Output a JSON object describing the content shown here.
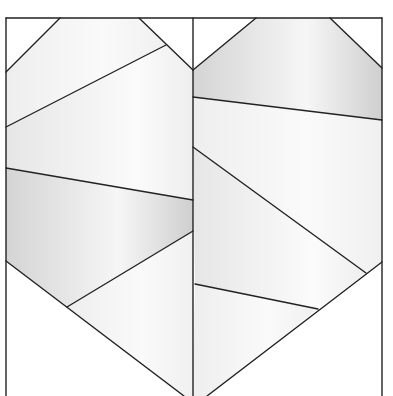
{
  "diagram": {
    "type": "geometric-line-pattern",
    "width": 393,
    "height": 396,
    "stroke_color": "#222222",
    "stroke_width": 1.4,
    "background": "#ffffff",
    "outer_frame": {
      "left": 6,
      "top": 18,
      "right": 382,
      "divider_x": 193
    },
    "shades": {
      "light": "#f3f3f3",
      "mid": "#e4e4e4",
      "dark": "#d2d2d2",
      "white": "#ffffff"
    },
    "regions": [
      {
        "name": "left-top-corner-triangle",
        "shade": "white",
        "points": "6,18 60,18 6,72"
      },
      {
        "name": "left-upper-band",
        "shade": "light",
        "points": "60,18 139,18 166,45 6,127 6,72"
      },
      {
        "name": "left-top-right-triangle",
        "shade": "white",
        "points": "139,18 193,18 193,70"
      },
      {
        "name": "left-middle-band",
        "shade": "mid",
        "points": "166,45 193,70 193,200 6,168 6,127"
      },
      {
        "name": "left-lower-band",
        "shade": "dark",
        "points": "6,168 193,200 193,231 67,307 6,261"
      },
      {
        "name": "left-bottom-wedge",
        "shade": "light",
        "points": "67,307 193,231 193,396 184,396"
      },
      {
        "name": "left-bottom-triangle",
        "shade": "white",
        "points": "6,261 67,307 184,396 6,396"
      },
      {
        "name": "right-top-left-triangle",
        "shade": "white",
        "points": "193,18 256,18 193,70"
      },
      {
        "name": "right-upper-band",
        "shade": "dark",
        "points": "256,18 330,18 382,68 382,120 193,97 193,70"
      },
      {
        "name": "right-top-corner-triangle",
        "shade": "white",
        "points": "330,18 382,18 382,68"
      },
      {
        "name": "right-middle-band",
        "shade": "light",
        "points": "193,97 382,120 382,262 366,273 193,147"
      },
      {
        "name": "right-diagonal-band",
        "shade": "mid",
        "points": "193,147 366,273 318,309 195,284"
      },
      {
        "name": "right-lower-band",
        "shade": "light",
        "points": "195,284 318,309 207,396 193,396"
      },
      {
        "name": "right-bottom-triangle",
        "shade": "white",
        "points": "382,262 382,396 207,396"
      }
    ],
    "lines": [
      {
        "name": "frame-top",
        "x1": 6,
        "y1": 18,
        "x2": 382,
        "y2": 18
      },
      {
        "name": "frame-left",
        "x1": 6,
        "y1": 18,
        "x2": 6,
        "y2": 396
      },
      {
        "name": "frame-right",
        "x1": 382,
        "y1": 18,
        "x2": 382,
        "y2": 396
      },
      {
        "name": "center-divider",
        "x1": 193,
        "y1": 18,
        "x2": 193,
        "y2": 396
      },
      {
        "name": "left-top-diagonal",
        "x1": 6,
        "y1": 72,
        "x2": 60,
        "y2": 18
      },
      {
        "name": "left-v-diagonal",
        "x1": 139,
        "y1": 18,
        "x2": 193,
        "y2": 70
      },
      {
        "name": "left-upper-slant",
        "x1": 6,
        "y1": 127,
        "x2": 166,
        "y2": 45
      },
      {
        "name": "left-middle-slant",
        "x1": 6,
        "y1": 168,
        "x2": 193,
        "y2": 200
      },
      {
        "name": "left-lower-diagonal",
        "x1": 6,
        "y1": 261,
        "x2": 184,
        "y2": 396
      },
      {
        "name": "left-lower-rise",
        "x1": 67,
        "y1": 307,
        "x2": 193,
        "y2": 231
      },
      {
        "name": "right-v-diagonal",
        "x1": 193,
        "y1": 70,
        "x2": 256,
        "y2": 18
      },
      {
        "name": "right-top-diagonal",
        "x1": 330,
        "y1": 18,
        "x2": 382,
        "y2": 68
      },
      {
        "name": "right-upper-slant",
        "x1": 193,
        "y1": 97,
        "x2": 382,
        "y2": 120
      },
      {
        "name": "right-middle-diagonal",
        "x1": 193,
        "y1": 147,
        "x2": 366,
        "y2": 273
      },
      {
        "name": "right-lower-slant",
        "x1": 195,
        "y1": 284,
        "x2": 318,
        "y2": 309
      },
      {
        "name": "right-bottom-diagonal",
        "x1": 382,
        "y1": 262,
        "x2": 207,
        "y2": 396
      }
    ]
  }
}
